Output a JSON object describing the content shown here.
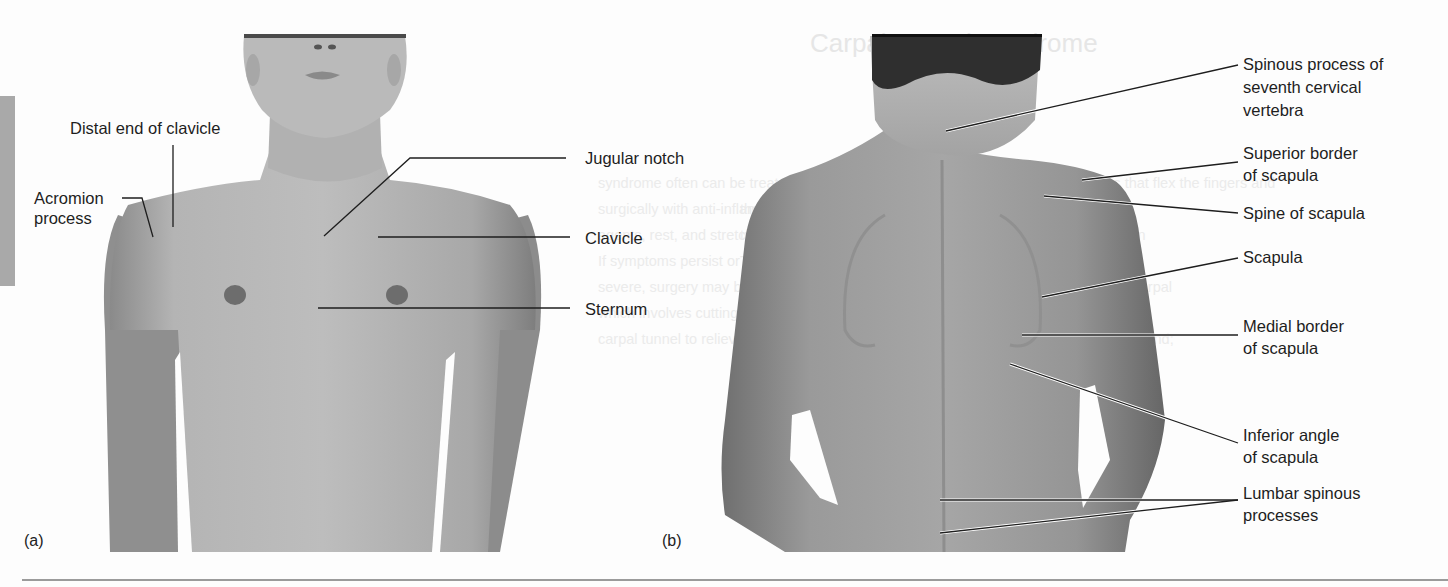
{
  "figure": {
    "panels": [
      {
        "tag": "(a)",
        "view": "anterior",
        "labels": {
          "distal_end_clavicle": "Distal end of clavicle",
          "acromion_process": "Acromion\nprocess",
          "jugular_notch": "Jugular notch",
          "clavicle": "Clavicle",
          "sternum": "Sternum"
        }
      },
      {
        "tag": "(b)",
        "view": "posterior",
        "labels": {
          "spinous_c7": "Spinous process of\nseventh cervical\nvertebra",
          "superior_border": "Superior border\nof scapula",
          "spine_scapula": "Spine of scapula",
          "scapula": "Scapula",
          "medial_border": "Medial border\nof scapula",
          "inferior_angle": "Inferior angle\nof scapula",
          "lumbar_spinous": "Lumbar spinous\nprocesses"
        }
      }
    ],
    "bleed_through": {
      "title": "Carpal Tunnel Syndrome",
      "left_col": [
        "syndrome often can be treated non-",
        "surgically with anti-inflammatory",
        "agents, rest, and stretching exercises.",
        "If symptoms persist or become more",
        "severe, surgery may be recommended,",
        "which involves cutting the ligament of the",
        "carpal tunnel to relieve pressure."
      ],
      "right_col": [
        "The tendons that flex the fingers and",
        "the anterior side of the wrist as accumulated fluid and",
        "tunnel, which does not normally expand, can apply pressure on",
        "Tendons and nerves pass through the tunnel.",
        "arm through the carpal tunnel; pressure on the nerve causes carpal",
        "tunnel syndrome, which is characterized by the",
        "accumulation in the carpal tunnel; tingling or numbness in the hand;",
        "result of inflammation; treatment of carpal tunnel syndrome",
        "overuse of the wrist; depending on the severity of the"
      ]
    },
    "colors": {
      "background": "#fdfdfd",
      "text": "#1e1e1e",
      "side_tab": "#a9a9a9",
      "skin_light": "#b5b5b5",
      "skin_dark": "#7d7d7d",
      "hair": "#2a2a2a",
      "rule": "#9b9b9b"
    }
  }
}
